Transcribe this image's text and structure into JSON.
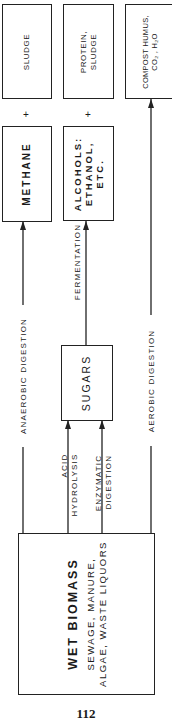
{
  "diagram": {
    "orientation": "rotated-90-ccw",
    "source": {
      "title": "WET BIOMASS",
      "line1": "SEWAGE, MANURE,",
      "line2": "ALGAE, WASTE LIQUORS"
    },
    "intermediate": {
      "sugars": "SUGARS"
    },
    "products": {
      "methane": "METHANE",
      "alcohols_line1": "ALCOHOLS:",
      "alcohols_line2": "ETHANOL,",
      "alcohols_line3": "ETC.",
      "sludge": "SLUDGE",
      "protein_line1": "PROTEIN,",
      "protein_line2": "SLUDGE",
      "compost_line1": "COMPOST HUMUS,",
      "compost_line2": "CO₂ , H₂O"
    },
    "plus_sign": "+",
    "processes": {
      "anaerobic": "ANAEROBIC  DIGESTION",
      "fermentation": "FERMENTATION",
      "aerobic": "AEROBIC  DIGESTION",
      "acid_line1": "ACID",
      "acid_line2": "HYDROLYSIS",
      "enzymatic_line1": "ENZYMATIC",
      "enzymatic_line2": "DIGESTION"
    },
    "edges": [
      {
        "from": "WET BIOMASS",
        "to": "METHANE",
        "label": "ANAEROBIC DIGESTION"
      },
      {
        "from": "WET BIOMASS",
        "to": "SUGARS",
        "label": "ACID HYDROLYSIS"
      },
      {
        "from": "WET BIOMASS",
        "to": "SUGARS",
        "label": "ENZYMATIC DIGESTION"
      },
      {
        "from": "SUGARS",
        "to": "ALCOHOLS: ETHANOL, ETC.",
        "label": "FERMENTATION"
      },
      {
        "from": "WET BIOMASS",
        "to": "COMPOST HUMUS, CO2, H2O",
        "label": "AEROBIC DIGESTION"
      }
    ]
  },
  "page_number": "112"
}
